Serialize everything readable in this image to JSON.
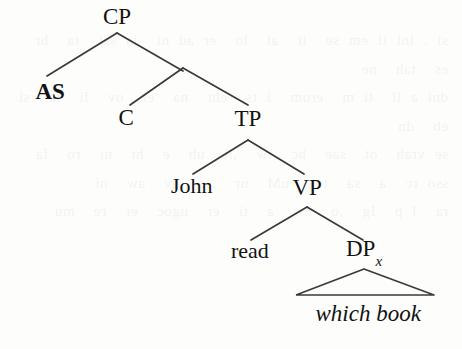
{
  "figure": {
    "type": "syntax-tree",
    "caption_text": "",
    "background_color": "#fdfdfc",
    "line_color": "#3a3a3a",
    "text_color": "#121212"
  },
  "bleed_through_text": "si . inl ti em se  it  al  lo  er ad ni  ia sat  ta  hr es  tah  ne\ndni a ll  ti m  erom  i ts  eht  na  el  ov  li  ta  si  eb  dn\nse vrah  ot  sae  hc  iw  ,ll  ub  e  ht  ni  ro  fa\nsso rc  a  sa  tcn  uM  ur  ,se  ev  aw  ni\nra  l p  Ig  ,o  hw  a  ti  er  ugoc  er  re  mu",
  "tree": {
    "nodes": [
      {
        "id": "cp",
        "label": "CP",
        "x": 117,
        "y": 16,
        "style": "cat",
        "name": "node-cp"
      },
      {
        "id": "as",
        "label": "AS",
        "x": 50,
        "y": 91,
        "style": "cat-bold",
        "name": "node-as"
      },
      {
        "id": "c",
        "label": "C",
        "x": 126,
        "y": 117,
        "style": "cat",
        "name": "node-c"
      },
      {
        "id": "tp",
        "label": "TP",
        "x": 248,
        "y": 118,
        "style": "cat",
        "name": "node-tp"
      },
      {
        "id": "john",
        "label": "John",
        "x": 192,
        "y": 186,
        "style": "lex",
        "name": "node-john"
      },
      {
        "id": "vp",
        "label": "VP",
        "x": 307,
        "y": 187,
        "style": "cat",
        "name": "node-vp"
      },
      {
        "id": "read",
        "label": "read",
        "x": 250,
        "y": 251,
        "style": "lex",
        "name": "node-read"
      },
      {
        "id": "dp",
        "label": "DP",
        "x": 364,
        "y": 251,
        "style": "cat",
        "name": "node-dp",
        "subscript": "x"
      },
      {
        "id": "whichbook",
        "label": "which book",
        "x": 368,
        "y": 313,
        "style": "lex-italic",
        "name": "node-which-book"
      }
    ],
    "edges": [
      {
        "from": "cp",
        "to": "as",
        "x1": 117,
        "y1": 33,
        "x2": 47,
        "y2": 76,
        "name": "branch-cp-as"
      },
      {
        "from": "cp",
        "to": "cbar",
        "x1": 117,
        "y1": 33,
        "x2": 183,
        "y2": 71,
        "name": "branch-cp-cbar"
      },
      {
        "from": "cbar",
        "to": "c",
        "x1": 183,
        "y1": 68,
        "x2": 130,
        "y2": 105,
        "name": "branch-cbar-c"
      },
      {
        "from": "cbar",
        "to": "tp",
        "x1": 183,
        "y1": 68,
        "x2": 248,
        "y2": 105,
        "name": "branch-cbar-tp"
      },
      {
        "from": "tp",
        "to": "john",
        "x1": 248,
        "y1": 140,
        "x2": 193,
        "y2": 174,
        "name": "branch-tp-john"
      },
      {
        "from": "tp",
        "to": "vp",
        "x1": 248,
        "y1": 140,
        "x2": 304,
        "y2": 174,
        "name": "branch-tp-vp"
      },
      {
        "from": "vp",
        "to": "read",
        "x1": 307,
        "y1": 207,
        "x2": 251,
        "y2": 240,
        "name": "branch-vp-read"
      },
      {
        "from": "vp",
        "to": "dp",
        "x1": 307,
        "y1": 207,
        "x2": 363,
        "y2": 240,
        "name": "branch-vp-dp"
      }
    ],
    "triangle": {
      "name": "triangle-dp-which-book",
      "apex_x": 364,
      "apex_y": 269,
      "left_x": 296,
      "left_y": 295,
      "right_x": 434,
      "right_y": 295
    }
  }
}
